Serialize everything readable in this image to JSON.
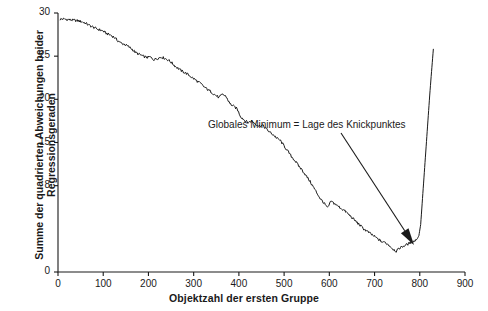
{
  "chart_data": {
    "type": "line",
    "title": "",
    "xlabel": "Objektzahl der ersten Gruppe",
    "ylabel_line1": "Summe der quadrierten Abweichungen  beider",
    "ylabel_line2": "Regressionsgeraden",
    "xlim": [
      0,
      900
    ],
    "ylim": [
      0,
      30
    ],
    "grid": false,
    "legend": false,
    "xticks": [
      0,
      100,
      200,
      300,
      400,
      500,
      600,
      700,
      800,
      900
    ],
    "xtick_labels": [
      "0",
      "100",
      "200",
      "300",
      "400",
      "500",
      "600",
      "700",
      "800",
      "900"
    ],
    "yticks": [
      0,
      8,
      15,
      20,
      25,
      30
    ],
    "ytick_labels": [
      "0",
      "8",
      "15",
      "20",
      "25",
      "30"
    ],
    "ytick_positions_value": [
      0,
      10,
      15,
      20,
      25,
      30
    ],
    "annotations": [
      {
        "text": "Globales Minimum = Lage des Knickpunktes",
        "x": 770,
        "y": 1.6,
        "text_x": 210,
        "text_y": 26.0,
        "arrow": true
      }
    ],
    "series": [
      {
        "name": "Summe der quadrierten Abweichungen",
        "color": "#1a1a1a",
        "x": [
          5,
          12,
          20,
          28,
          36,
          44,
          52,
          60,
          68,
          76,
          84,
          92,
          100,
          108,
          116,
          124,
          132,
          140,
          148,
          156,
          164,
          172,
          180,
          188,
          196,
          204,
          212,
          220,
          228,
          236,
          244,
          252,
          260,
          268,
          276,
          284,
          292,
          300,
          308,
          316,
          324,
          332,
          340,
          348,
          356,
          364,
          372,
          380,
          388,
          396,
          404,
          412,
          420,
          428,
          436,
          444,
          452,
          460,
          468,
          476,
          484,
          492,
          500,
          508,
          516,
          524,
          532,
          540,
          548,
          556,
          564,
          572,
          580,
          588,
          596,
          604,
          612,
          620,
          628,
          636,
          644,
          652,
          660,
          668,
          676,
          684,
          692,
          700,
          708,
          716,
          724,
          732,
          740,
          748,
          756,
          764,
          772,
          780,
          788,
          794,
          798,
          802,
          806,
          810,
          814,
          818,
          822,
          826,
          830
        ],
        "y": [
          29.3,
          29.3,
          29.25,
          29.2,
          29.15,
          29.1,
          29.0,
          28.85,
          28.6,
          28.4,
          28.2,
          28.05,
          27.9,
          27.6,
          27.45,
          27.2,
          26.8,
          26.5,
          26.35,
          26.1,
          25.8,
          25.4,
          25.2,
          25.0,
          24.85,
          24.9,
          24.6,
          24.75,
          24.9,
          24.75,
          24.55,
          24.2,
          23.8,
          23.5,
          23.2,
          23.0,
          22.7,
          22.4,
          22.1,
          21.8,
          21.4,
          21.1,
          20.8,
          20.5,
          20.2,
          20.6,
          20.3,
          19.5,
          19.2,
          18.9,
          18.0,
          17.6,
          17.3,
          17.5,
          17.2,
          16.9,
          17.0,
          16.6,
          16.2,
          15.9,
          15.5,
          15.2,
          14.6,
          14.0,
          13.4,
          12.9,
          12.3,
          11.8,
          11.2,
          10.6,
          9.9,
          9.2,
          8.5,
          8.0,
          7.4,
          8.2,
          7.9,
          7.6,
          7.3,
          7.0,
          6.6,
          6.2,
          5.8,
          5.4,
          5.0,
          4.7,
          4.4,
          4.1,
          3.8,
          3.5,
          3.4,
          3.1,
          2.7,
          2.4,
          2.8,
          3.0,
          3.2,
          3.4,
          3.6,
          3.8,
          4.2,
          5.5,
          8.5,
          11.5,
          14.5,
          17.5,
          20.5,
          23.2,
          25.8
        ]
      }
    ]
  }
}
